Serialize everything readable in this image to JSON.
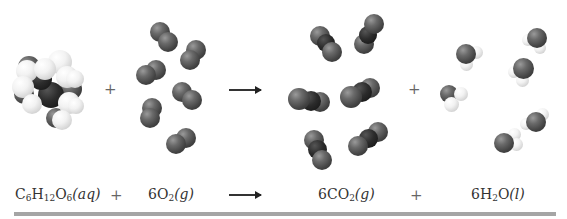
{
  "diagram": {
    "reactants": [
      {
        "id": "glucose",
        "formula_parts": [
          "C",
          "6",
          "H",
          "12",
          "O",
          "6"
        ],
        "state": "aq",
        "coefficient": "",
        "count_shown": 1
      },
      {
        "id": "oxygen",
        "formula_parts": [
          "O",
          "2"
        ],
        "state": "g",
        "coefficient": "6",
        "count_shown": 6
      }
    ],
    "products": [
      {
        "id": "carbon-dioxide",
        "formula_parts": [
          "CO",
          "2"
        ],
        "state": "g",
        "coefficient": "6",
        "count_shown": 6
      },
      {
        "id": "water",
        "formula_parts": [
          "H",
          "2",
          "O"
        ],
        "state": "l",
        "coefficient": "6",
        "count_shown": 6
      }
    ],
    "operators": {
      "plus": "+",
      "arrow": "⟶"
    },
    "equation_text": "C6H12O6(aq) + 6O2(g) ⟶ 6CO2(g) + 6H2O(l)",
    "colors": {
      "oxygen_atom": "#5a5a5a",
      "carbon_atom": "#1e1e1e",
      "hydrogen_atom": "#f2f2f2",
      "text": "#333333",
      "bar": "#a5a5a5",
      "background": "#ffffff"
    }
  },
  "equation": {
    "glucose": {
      "C": "C",
      "c_sub": "6",
      "H": "H",
      "h_sub": "12",
      "O": "O",
      "o_sub": "6",
      "state": "(aq)"
    },
    "plus1": "+",
    "oxygen": {
      "coef": "6",
      "O": "O",
      "o_sub": "2",
      "state": "(g)"
    },
    "arrow": "",
    "co2": {
      "coef": "6",
      "CO": "CO",
      "o_sub": "2",
      "state": "(g)"
    },
    "plus2": "+",
    "water": {
      "coef": "6",
      "H": "H",
      "h_sub": "2",
      "O": "O",
      "state": "(l)"
    }
  },
  "model_row": {
    "plus1": "+",
    "plus2": "+"
  }
}
